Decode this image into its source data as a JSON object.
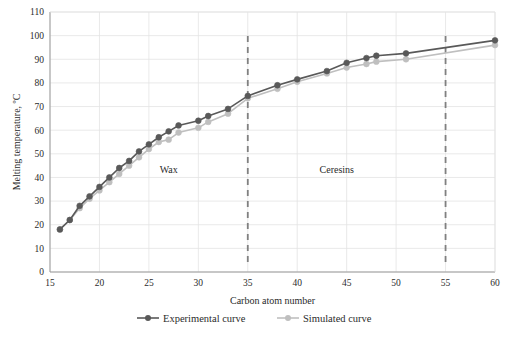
{
  "chart_data": {
    "type": "line",
    "title": "",
    "subtitle": "",
    "xlabel": "Carbon atom number",
    "ylabel": "Melting temperature, ºC",
    "xlim": [
      15,
      60
    ],
    "ylim": [
      0,
      110
    ],
    "xticks": [
      15,
      20,
      25,
      30,
      35,
      40,
      45,
      50,
      55,
      60
    ],
    "yticks": [
      0,
      10,
      20,
      30,
      40,
      50,
      60,
      70,
      80,
      90,
      100,
      110
    ],
    "xtick_labels": [
      "15",
      "20",
      "25",
      "30",
      "35",
      "40",
      "45",
      "50",
      "55",
      "60"
    ],
    "ytick_labels": [
      "0",
      "10",
      "20",
      "30",
      "40",
      "50",
      "60",
      "70",
      "80",
      "90",
      "100",
      "110"
    ],
    "grid": true,
    "grid_axis": "both",
    "legend_position": "bottom",
    "series": [
      {
        "name": "Experimental curve",
        "color": "#595959",
        "marker": "circle",
        "x": [
          16,
          17,
          18,
          19,
          20,
          21,
          22,
          23,
          24,
          25,
          26,
          27,
          28,
          30,
          31,
          33,
          35,
          38,
          40,
          43,
          45,
          47,
          48,
          51,
          60
        ],
        "values": [
          18,
          22,
          28,
          32,
          36,
          40,
          44,
          47,
          51,
          54,
          57,
          59.5,
          62,
          64,
          66,
          69,
          74.5,
          79,
          81.5,
          85,
          88.5,
          90.5,
          91.5,
          92.5,
          98
        ]
      },
      {
        "name": "Simulated curve",
        "color": "#bfbfbf",
        "marker": "circle",
        "x": [
          16,
          17,
          18,
          19,
          20,
          21,
          22,
          23,
          24,
          25,
          26,
          27,
          28,
          30,
          31,
          33,
          35,
          38,
          40,
          43,
          45,
          47,
          48,
          51,
          60
        ],
        "values": [
          18,
          22,
          27,
          31,
          34.5,
          38,
          41.5,
          45,
          48.5,
          52,
          55,
          56,
          59,
          61,
          63.5,
          67,
          73.5,
          77.5,
          80.5,
          84,
          86.5,
          88,
          89,
          90,
          96
        ]
      }
    ],
    "annotations": [
      {
        "type": "vline",
        "x": 35,
        "style": "dashed",
        "color": "#808080"
      },
      {
        "type": "vline",
        "x": 55,
        "style": "dashed",
        "color": "#808080"
      },
      {
        "type": "text",
        "label": "Wax",
        "x": 27,
        "y": 42
      },
      {
        "type": "text",
        "label": "Ceresins",
        "x": 44,
        "y": 42
      }
    ]
  },
  "legend": {
    "items": [
      {
        "label": "Experimental curve",
        "color": "#595959"
      },
      {
        "label": "Simulated curve",
        "color": "#bfbfbf"
      }
    ]
  }
}
